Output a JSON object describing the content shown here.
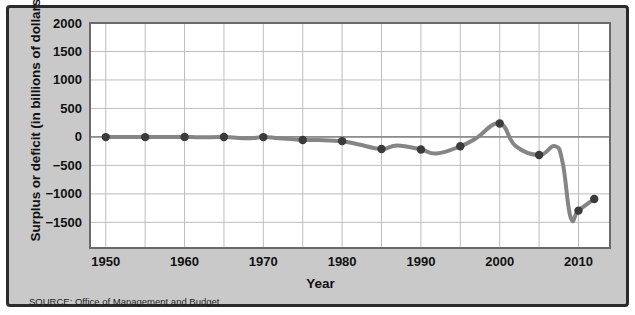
{
  "figure": {
    "source_note": "SOURCE: Office of Management and Budget",
    "frame_color": "#2b2b2b",
    "background_color": "#c9c9c9",
    "plot_background_color": "#ffffff"
  },
  "chart_data": {
    "type": "line",
    "title": "",
    "xlabel": "Year",
    "ylabel": "Surplus or deficit (in billions of dollars)",
    "xlim": [
      1948,
      2014
    ],
    "ylim": [
      -1950,
      2000
    ],
    "xticks": [
      1950,
      1960,
      1970,
      1980,
      1990,
      2000,
      2010
    ],
    "xtick_labels": [
      "1950",
      "1960",
      "1970",
      "1980",
      "1990",
      "2000",
      "2010"
    ],
    "x_minor_step": 5,
    "yticks": [
      2000,
      1500,
      1000,
      500,
      0,
      -500,
      -1000,
      -1500
    ],
    "ytick_labels": [
      "2000",
      "1500",
      "1000",
      "500",
      "0",
      "−500",
      "−1000",
      "−1500"
    ],
    "grid": true,
    "grid_color": "#bdbdbd",
    "zero_line": true,
    "legend": "none",
    "line_color": "#858585",
    "marker_color": "#3b3b3b",
    "line_width": 4,
    "marker_radius": 4.2,
    "markers_at": [
      1950,
      1955,
      1960,
      1965,
      1970,
      1975,
      1980,
      1985,
      1990,
      1995,
      2000,
      2005,
      2010,
      2012
    ],
    "x": [
      1950,
      1952,
      1955,
      1958,
      1960,
      1962,
      1965,
      1968,
      1970,
      1972,
      1975,
      1977,
      1980,
      1982,
      1985,
      1987,
      1990,
      1992,
      1995,
      1997,
      2000,
      2002,
      2005,
      2007,
      2008,
      2009,
      2010,
      2012
    ],
    "values": [
      -3,
      -2,
      -3,
      -3,
      0,
      -7,
      -1,
      -25,
      -3,
      -23,
      -53,
      -54,
      -74,
      -128,
      -212,
      -150,
      -221,
      -290,
      -164,
      -22,
      236,
      -158,
      -318,
      -161,
      -459,
      -1413,
      -1294,
      -1090
    ],
    "series": [
      {
        "name": "Federal surplus or deficit",
        "points": [
          {
            "year": 1950,
            "value": -3
          },
          {
            "year": 1955,
            "value": -3
          },
          {
            "year": 1960,
            "value": 0
          },
          {
            "year": 1965,
            "value": -1
          },
          {
            "year": 1970,
            "value": -3
          },
          {
            "year": 1975,
            "value": -53
          },
          {
            "year": 1980,
            "value": -74
          },
          {
            "year": 1985,
            "value": -212
          },
          {
            "year": 1990,
            "value": -221
          },
          {
            "year": 1995,
            "value": -164
          },
          {
            "year": 2000,
            "value": 236
          },
          {
            "year": 2005,
            "value": -318
          },
          {
            "year": 2010,
            "value": -1294
          },
          {
            "year": 2012,
            "value": -1090
          }
        ]
      }
    ]
  }
}
